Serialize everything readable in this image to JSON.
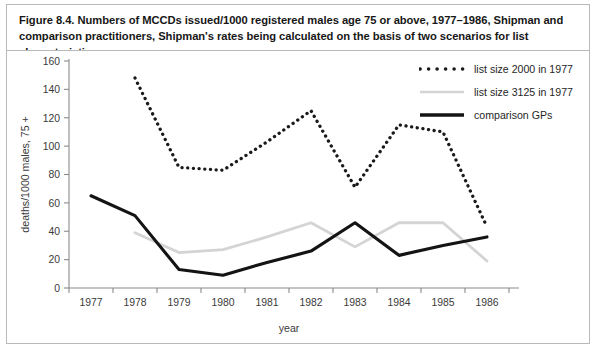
{
  "caption": {
    "text": "Figure 8.4. Numbers of MCCDs issued/1000 registered males age 75 or above, 1977–1986, Shipman and comparison practitioners, Shipman's rates being calculated on the basis of two scenarios for list characteristics."
  },
  "legend": {
    "items": [
      {
        "label": "list size 2000 in 1977",
        "style": "dotted",
        "color": "#1a1a1a"
      },
      {
        "label": "list size 3125 in 1977",
        "style": "solid-light",
        "color": "#d4d4d4"
      },
      {
        "label": "comparison GPs",
        "style": "solid-bold",
        "color": "#141414"
      }
    ]
  },
  "colors": {
    "frame": "#b9b9b9",
    "axis": "#8a8a8a",
    "tick_text": "#3a3a3a",
    "dotted_series": "#1a1a1a",
    "light_series": "#d4d4d4",
    "bold_series": "#141414"
  },
  "chart_data": {
    "type": "line",
    "title": "Numbers of MCCDs issued/1000 registered males age 75 or above, 1977–1986, Shipman and comparison practitioners",
    "xlabel": "year",
    "ylabel": "deaths/1000 males, 75 +",
    "categories": [
      "1977",
      "1978",
      "1979",
      "1980",
      "1981",
      "1982",
      "1983",
      "1984",
      "1985",
      "1986"
    ],
    "xtick_labels": [
      "1977",
      "1978",
      "1979",
      "1980",
      "1981",
      "1982",
      "1983",
      "1984",
      "1985",
      "1986"
    ],
    "ytick_labels": [
      "0",
      "20",
      "40",
      "60",
      "80",
      "100",
      "120",
      "140",
      "160"
    ],
    "yticks": [
      0,
      20,
      40,
      60,
      80,
      100,
      120,
      140,
      160
    ],
    "ylim": [
      0,
      160
    ],
    "grid": false,
    "legend_position": "top-right",
    "series": [
      {
        "name": "list size 2000 in 1977",
        "style": "dotted",
        "color": "#1a1a1a",
        "x": [
          "1978",
          "1979",
          "1980",
          "1981",
          "1982",
          "1983",
          "1984",
          "1985",
          "1986"
        ],
        "values": [
          148,
          85,
          83,
          103,
          125,
          71,
          115,
          110,
          43
        ]
      },
      {
        "name": "list size 3125 in 1977",
        "style": "solid-light",
        "color": "#d4d4d4",
        "x": [
          "1978",
          "1979",
          "1980",
          "1981",
          "1982",
          "1983",
          "1984",
          "1985",
          "1986"
        ],
        "values": [
          39,
          25,
          27,
          36,
          46,
          29,
          46,
          46,
          19
        ]
      },
      {
        "name": "comparison GPs",
        "style": "solid-bold",
        "color": "#141414",
        "x": [
          "1977",
          "1978",
          "1979",
          "1980",
          "1981",
          "1982",
          "1983",
          "1984",
          "1985",
          "1986"
        ],
        "values": [
          65,
          51,
          13,
          9,
          18,
          26,
          46,
          23,
          30,
          36
        ]
      }
    ]
  }
}
